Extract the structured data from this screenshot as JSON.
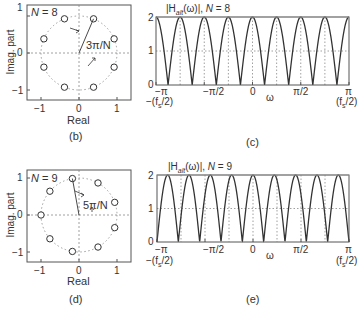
{
  "colors": {
    "curve": "#333333",
    "frame": "#555555",
    "grid": "#888888",
    "zero": "#333333"
  },
  "chart_data": [
    {
      "id": "b",
      "type": "scatter",
      "subtitle": "N = 8",
      "panel_label": "(b)",
      "xlabel": "Real",
      "ylabel": "Imag. part",
      "xticks": [
        "−1",
        "0",
        "1"
      ],
      "yticks": [
        "1",
        "0",
        "−1"
      ],
      "xlim": [
        -1.35,
        1.35
      ],
      "ylim": [
        -1.3,
        1.3
      ],
      "annotation": "3π/N",
      "unit_circle": true,
      "zeros_angles_deg": [
        22.5,
        67.5,
        112.5,
        157.5,
        202.5,
        247.5,
        292.5,
        337.5
      ]
    },
    {
      "id": "c",
      "type": "line",
      "title": "|Hₐₗₜ(ω)|,  N = 8",
      "panel_label": "(c)",
      "xlabel": "ω",
      "x_range": [
        -3.14159,
        3.14159
      ],
      "ylim": [
        0,
        2
      ],
      "yticks": [
        "0",
        "1",
        "2"
      ],
      "xticks": [
        "−π",
        "−π/2",
        "0",
        "π/2",
        "π"
      ],
      "xtick_sublabels": [
        "−(fs/2)",
        "",
        "",
        "",
        "(fs/2)"
      ],
      "formula": "2|cos(Nω/2)|",
      "N": 8,
      "grid_x_quarter_pi": true
    },
    {
      "id": "d",
      "type": "scatter",
      "subtitle": "N = 9",
      "panel_label": "(d)",
      "xlabel": "Real",
      "ylabel": "Imag. part",
      "xticks": [
        "−1",
        "0",
        "1"
      ],
      "yticks": [
        "1",
        "0",
        "−1"
      ],
      "xlim": [
        -1.35,
        1.35
      ],
      "ylim": [
        -1.3,
        1.3
      ],
      "annotation": "5π/N",
      "unit_circle": true,
      "zeros_angles_deg": [
        20,
        60,
        100,
        140,
        180,
        220,
        260,
        300,
        340
      ]
    },
    {
      "id": "e",
      "type": "line",
      "title": "|Hₐₗₜ(ω)|,  N = 9",
      "panel_label": "(e)",
      "xlabel": "ω",
      "x_range": [
        -3.14159,
        3.14159
      ],
      "ylim": [
        0,
        2
      ],
      "yticks": [
        "0",
        "1",
        "2"
      ],
      "xticks": [
        "−π",
        "−π/2",
        "0",
        "π/2",
        "π"
      ],
      "xtick_sublabels": [
        "−(fs/2)",
        "",
        "",
        "",
        "(fs/2)"
      ],
      "formula": "2|cos(Nω/2)|",
      "N": 9,
      "grid_x_quarter_pi": true
    }
  ],
  "text": {
    "b": {
      "n": "N",
      "eq": " = 8",
      "ann": "3π/N",
      "xl": "Real",
      "yl": "Imag. part",
      "panel": "(b)",
      "t1": "1",
      "t0": "0",
      "tm1": "−1"
    },
    "d": {
      "n": "N",
      "eq": " = 9",
      "ann": "5π/N",
      "xl": "Real",
      "yl": "Imag. part",
      "panel": "(d)",
      "t1": "1",
      "t0": "0",
      "tm1": "−1"
    },
    "c": {
      "h": "|H",
      "sub": "alt",
      "rest": "(ω)|,  ",
      "n": "N",
      "eq": " = 8",
      "panel": "(c)",
      "w": "ω",
      "mpi": "−π",
      "mpi2": "−π/2",
      "z": "0",
      "pi2": "π/2",
      "pi": "π",
      "fsl": "−(f",
      "fsr": "(f",
      "s": "s",
      "half": "/2)",
      "y2": "2",
      "y1": "1",
      "y0": "0"
    },
    "e": {
      "h": "|H",
      "sub": "alt",
      "rest": "(ω)|,  ",
      "n": "N",
      "eq": " = 9",
      "panel": "(e)",
      "w": "ω",
      "mpi": "−π",
      "mpi2": "−π/2",
      "z": "0",
      "pi2": "π/2",
      "pi": "π",
      "fsl": "−(f",
      "fsr": "(f",
      "s": "s",
      "half": "/2)",
      "y2": "2",
      "y1": "1",
      "y0": "0"
    }
  }
}
